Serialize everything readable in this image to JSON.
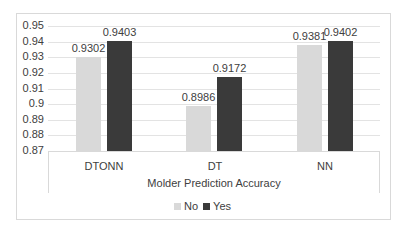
{
  "chart_data": {
    "type": "bar",
    "title": "",
    "xlabel": "Molder Prediction Accuracy",
    "ylabel": "",
    "categories": [
      "DTONN",
      "DT",
      "NN"
    ],
    "series": [
      {
        "name": "No",
        "color": "#d9d9d9",
        "values": [
          0.9302,
          0.8986,
          0.9381
        ]
      },
      {
        "name": "Yes",
        "color": "#3a3a3a",
        "values": [
          0.9403,
          0.9172,
          0.9402
        ]
      }
    ],
    "data_labels": {
      "No": [
        "0.9302",
        "0.8986",
        "0.9381"
      ],
      "Yes": [
        "0.9403",
        "0.9172",
        "0.9402"
      ]
    },
    "ylim": [
      0.87,
      0.95
    ],
    "yticks": [
      "0.95",
      "0.94",
      "0.93",
      "0.92",
      "0.91",
      "0.9",
      "0.89",
      "0.88",
      "0.87"
    ],
    "grid": true,
    "legend_position": "bottom"
  },
  "legend": {
    "no_label": "No",
    "yes_label": "Yes"
  }
}
